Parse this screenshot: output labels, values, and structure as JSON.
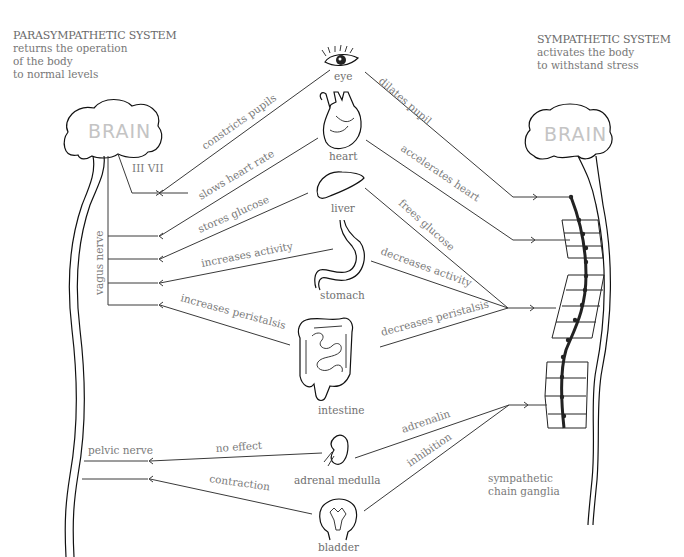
{
  "parasympathetic": {
    "title": "PARASYMPATHETIC SYSTEM",
    "desc_lines": [
      "returns the operation",
      "of the body",
      "to normal levels"
    ],
    "brain_label": "BRAIN",
    "cranial_nerves": "III  VII",
    "vagus_label": "vagus nerve",
    "pelvic_label": "pelvic nerve"
  },
  "sympathetic": {
    "title": "SYMPATHETIC SYSTEM",
    "desc_lines": [
      "activates the body",
      "to withstand stress"
    ],
    "brain_label": "BRAIN",
    "ganglia_label_lines": [
      "sympathetic",
      "chain ganglia"
    ]
  },
  "organs": [
    {
      "name": "eye",
      "para_effect": "constricts pupils",
      "symp_effect": "dilates pupil"
    },
    {
      "name": "heart",
      "para_effect": "slows heart rate",
      "symp_effect": "accelerates heart"
    },
    {
      "name": "liver",
      "para_effect": "stores glucose",
      "symp_effect": "frees glucose"
    },
    {
      "name": "stomach",
      "para_effect": "increases activity",
      "symp_effect": "decreases activity"
    },
    {
      "name": "intestine",
      "para_effect": "increases peristalsis",
      "symp_effect": "decreases peristalsis"
    },
    {
      "name": "adrenal medulla",
      "para_effect": "no effect",
      "symp_effect": "adrenalin"
    },
    {
      "name": "bladder",
      "para_effect": "contraction",
      "symp_effect": "inhibition"
    }
  ],
  "colors": {
    "line": "#3a3a3a",
    "text": "#7a7a7a",
    "brain_text": "#c4c4c4"
  }
}
